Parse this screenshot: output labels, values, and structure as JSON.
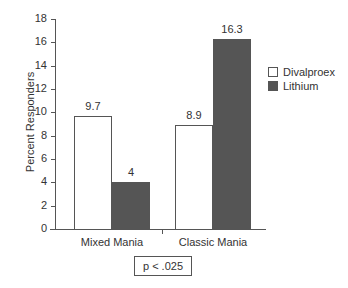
{
  "chart_data": {
    "type": "bar",
    "title": "",
    "xlabel": "",
    "ylabel": "Percent Responders",
    "ylim": [
      0,
      18
    ],
    "yticks": [
      0,
      2,
      4,
      6,
      8,
      10,
      12,
      14,
      16,
      18
    ],
    "categories": [
      "Mixed Mania",
      "Classic Mania"
    ],
    "series": [
      {
        "name": "Divalproex",
        "color": "#ffffff",
        "values": [
          9.7,
          8.9
        ]
      },
      {
        "name": "Lithium",
        "color": "#555555",
        "values": [
          4,
          16.3
        ]
      }
    ],
    "data_labels": [
      [
        "9.7",
        "8.9"
      ],
      [
        "4",
        "16.3"
      ]
    ],
    "legend_position": "right",
    "grid": false,
    "annotation": "p < .025"
  }
}
